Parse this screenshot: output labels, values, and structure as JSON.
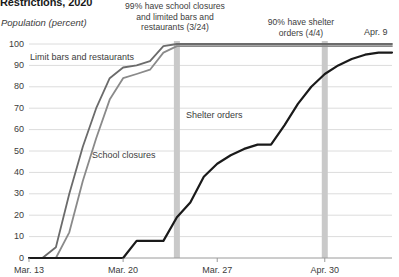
{
  "chart_data": {
    "type": "line",
    "title": "Restrictions, 2020",
    "ylabel": "Population (percent)",
    "xlabel": "",
    "ylim": [
      0,
      100
    ],
    "yticks": [
      "100",
      "90",
      "80",
      "70",
      "60",
      "50",
      "40",
      "30",
      "20",
      "10",
      "0"
    ],
    "xticks": [
      "Mar. 13",
      "Mar. 20",
      "Mar. 27",
      "Apr. 30"
    ],
    "xtick_days": [
      0,
      7,
      14,
      22
    ],
    "x_end_label": "Apr. 9",
    "grid": true,
    "legend": "inline-labels",
    "x": [
      0,
      1,
      2,
      3,
      4,
      5,
      6,
      7,
      8,
      9,
      10,
      11,
      12,
      13,
      14,
      15,
      16,
      17,
      18,
      19,
      20,
      21,
      22,
      23,
      24,
      25,
      26,
      27
    ],
    "series": [
      {
        "name": "Limit bars and restaurants",
        "color": "#6b6b6b",
        "label_x": 30,
        "label_y": 52,
        "values": [
          0,
          0,
          5,
          30,
          52,
          70,
          84,
          89,
          90,
          92,
          99,
          100,
          100,
          100,
          100,
          100,
          100,
          100,
          100,
          100,
          100,
          100,
          100,
          100,
          100,
          100,
          100,
          100
        ]
      },
      {
        "name": "School closures",
        "color": "#8a8a8a",
        "label_x": 92,
        "label_y": 150,
        "values": [
          0,
          0,
          0,
          12,
          36,
          56,
          74,
          84,
          86,
          88,
          96,
          99,
          99,
          99,
          99,
          99,
          99,
          99,
          99,
          99,
          99,
          99,
          99,
          99,
          99,
          99,
          99,
          99
        ]
      },
      {
        "name": "Shelter orders",
        "color": "#1a1a1a",
        "label_x": 186,
        "label_y": 110,
        "values": [
          0,
          0,
          0,
          0,
          0,
          0,
          0,
          0,
          8,
          8,
          8,
          19,
          26,
          38,
          44,
          48,
          51,
          53,
          53,
          62,
          72,
          80,
          86,
          90,
          93,
          95,
          96,
          96
        ]
      }
    ],
    "annotations": [
      {
        "id": "school-closures-bars-annotation",
        "text": "99% have school closures\nand limited bars and\nrestaurants (3/24)",
        "band_day": 11,
        "band_color": "#c9c9c9",
        "x": 110,
        "y": 1,
        "width": 130
      },
      {
        "id": "shelter-orders-annotation",
        "text": "90% have shelter\norders (4/4)",
        "band_day": 22,
        "band_color": "#c9c9c9",
        "x": 256,
        "y": 17,
        "width": 90
      }
    ],
    "colors": {
      "grid": "#dcdcdc",
      "axis": "#9a9a9a",
      "band": "#c9c9c9",
      "text": "#3c3c3c"
    }
  }
}
